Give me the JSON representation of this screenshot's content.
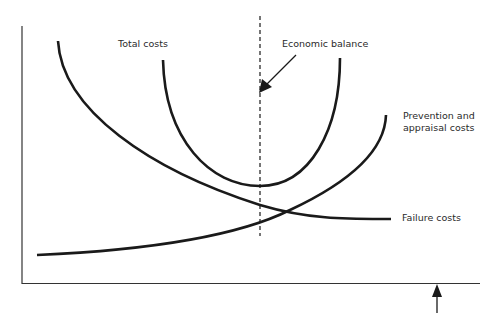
{
  "diagram": {
    "type": "cost-of-quality",
    "colors": {
      "line": "#1a1a1a",
      "axis": "#333333",
      "text": "#2a2a2a",
      "background": "#ffffff"
    },
    "labels": {
      "total_costs": "Total costs",
      "economic_balance": "Economic balance",
      "prevention_line1": "Prevention and",
      "prevention_line2": "appraisal costs",
      "failure_costs": "Failure costs"
    },
    "curves": [
      {
        "name": "Failure costs",
        "shape": "decreasing"
      },
      {
        "name": "Prevention and appraisal costs",
        "shape": "increasing"
      },
      {
        "name": "Total costs",
        "shape": "U-shaped, minimum at economic balance"
      }
    ],
    "markers": {
      "economic_balance_line": "dashed vertical at total cost minimum",
      "x_axis_arrow": "upward arrow below x-axis near right end"
    }
  }
}
